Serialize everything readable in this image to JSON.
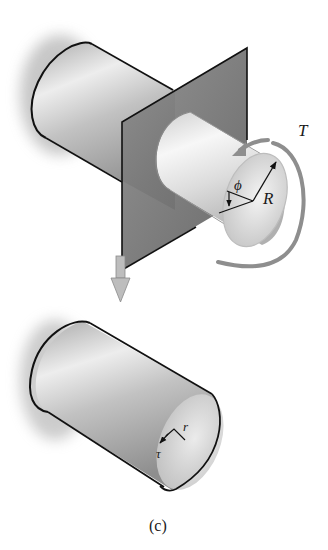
{
  "figure": {
    "caption": "(c)",
    "top_view": {
      "description": "Circular shaft cut by a section plane, torque applied at free end",
      "labels": {
        "torque": "T",
        "radius": "R",
        "angle": "ϕ"
      }
    },
    "arrow": {
      "description": "Downward arrow indicating extracted segment"
    },
    "bottom_view": {
      "description": "Extracted shaft segment showing shear stress at radius r",
      "labels": {
        "radius": "r",
        "shear_stress": "τ"
      }
    }
  },
  "colors": {
    "cylinder_light": "#f2f2f2",
    "cylinder_mid": "#c8c8c8",
    "cylinder_dark": "#9a9a9a",
    "plane": "#707070",
    "torque_arrow": "#8c8c8c",
    "down_arrow": "#b0b0b0",
    "outline": "#111111"
  }
}
